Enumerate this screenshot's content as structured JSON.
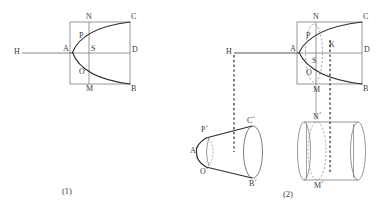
{
  "figure": {
    "kind": "geometry-diagram",
    "stroke_color": "#4a4a4a",
    "curve_color": "#2e2e2e",
    "dash_color": "#555555",
    "background": "#ffffff"
  },
  "panel1": {
    "caption": "(1)",
    "labels": {
      "H": "H",
      "A": "A",
      "N": "N",
      "P": "P",
      "S": "S",
      "O": "O",
      "M": "M",
      "C": "C",
      "D": "D",
      "B": "B"
    }
  },
  "panel2": {
    "caption": "(2)",
    "labels": {
      "H": "H",
      "A": "A",
      "N": "N",
      "P": "P",
      "S": "S",
      "K": "K",
      "O": "O",
      "M": "M",
      "C": "C",
      "D": "D",
      "B": "B",
      "A_prime": "A´",
      "P_prime": "P´",
      "O_prime": "O´",
      "C_prime": "C´",
      "B_prime": "B´",
      "N_prime": "N´",
      "M_prime": "M´"
    }
  }
}
